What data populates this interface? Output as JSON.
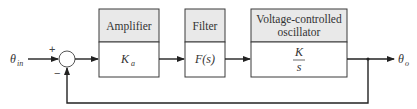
{
  "diagram": {
    "type": "block-diagram",
    "input": {
      "symbol": "θ",
      "subscript": "in"
    },
    "output": {
      "symbol": "θ",
      "subscript": "o"
    },
    "summing_junction": {
      "plus_sign": "+",
      "minus_sign": "−"
    },
    "blocks": [
      {
        "id": "amplifier",
        "header": "Amplifier",
        "body_symbol": "K",
        "body_subscript": "a"
      },
      {
        "id": "filter",
        "header": "Filter",
        "body": "F(s)"
      },
      {
        "id": "vco",
        "header_line1": "Voltage-controlled",
        "header_line2": "oscillator",
        "numerator": "K",
        "denominator": "s"
      }
    ],
    "colors": {
      "header_fill": "#e9e9e9",
      "body_fill": "#ffffff",
      "stroke": "#3a3a3a",
      "text": "#333333"
    }
  }
}
